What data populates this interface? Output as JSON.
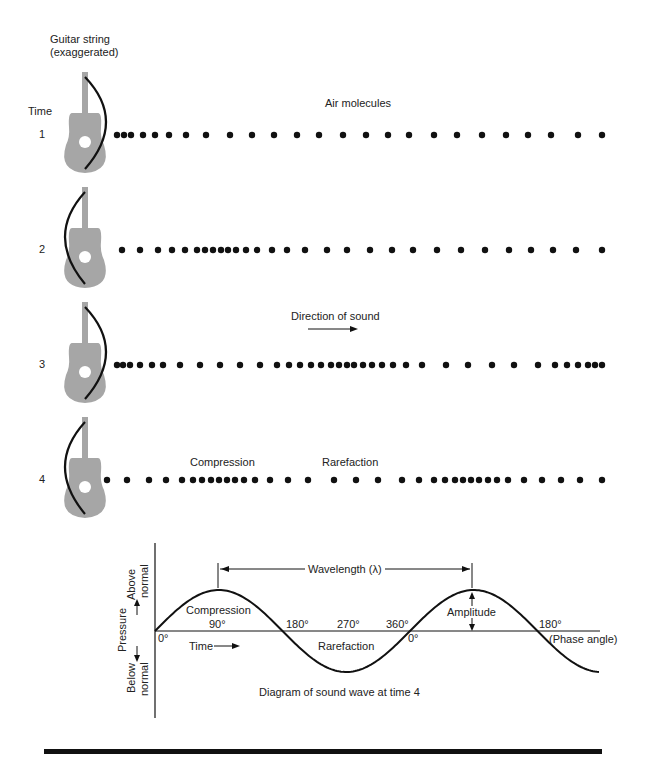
{
  "header": {
    "guitar_label_line1": "Guitar string",
    "guitar_label_line2": "(exaggerated)",
    "time_label": "Time",
    "air_molecules_label": "Air molecules",
    "direction_label": "Direction of sound",
    "compression_label": "Compression",
    "rarefaction_label": "Rarefaction"
  },
  "rows": [
    {
      "label": "1",
      "y": 135,
      "string_bow": "right",
      "dots": [
        117,
        124,
        131,
        143,
        155,
        169,
        186,
        206,
        230,
        252,
        274,
        297,
        319,
        343,
        366,
        388,
        409,
        434,
        457,
        482,
        506,
        528,
        551,
        578,
        602
      ]
    },
    {
      "label": "2",
      "y": 250,
      "string_bow": "left",
      "dots": [
        122,
        140,
        158,
        172,
        185,
        197,
        205,
        213,
        221,
        228,
        236,
        246,
        257,
        272,
        287,
        305,
        327,
        347,
        370,
        392,
        413,
        437,
        461,
        485,
        509,
        531,
        553,
        576,
        602
      ]
    },
    {
      "label": "3",
      "y": 365,
      "string_bow": "right",
      "dots": [
        117,
        123,
        130,
        140,
        152,
        163,
        180,
        200,
        220,
        240,
        260,
        277,
        289,
        300,
        311,
        321,
        331,
        339,
        347,
        354,
        363,
        372,
        382,
        393,
        406,
        422,
        446,
        468,
        492,
        514,
        538,
        555,
        567,
        578,
        588,
        595,
        602
      ]
    },
    {
      "label": "4",
      "y": 480,
      "string_bow": "left",
      "dots": [
        107,
        127,
        149,
        166,
        182,
        193,
        202,
        211,
        219,
        227,
        235,
        244,
        255,
        270,
        288,
        308,
        334,
        356,
        378,
        402,
        419,
        434,
        445,
        455,
        463,
        471,
        479,
        488,
        497,
        508,
        524,
        542,
        561,
        580,
        602
      ]
    }
  ],
  "wave_diagram": {
    "wavelength_label": "Wavelength (λ)",
    "amplitude_label": "Amplitude",
    "compression_label": "Compression",
    "rarefaction_label": "Rarefaction",
    "time_label": "Time",
    "phase_angle_label": "(Phase angle)",
    "pressure_label": "Pressure",
    "above_normal_line1": "Above",
    "above_normal_line2": "normal",
    "below_normal_line1": "Below",
    "below_normal_line2": "normal",
    "angles": {
      "a0": "0°",
      "a90": "90°",
      "a180": "180°",
      "a270": "270°",
      "a360": "360°",
      "a0b": "0°",
      "a180b": "180°"
    },
    "caption": "Diagram of sound wave at time 4"
  },
  "colors": {
    "ink": "#111111",
    "guitar": "#a6a6a6",
    "background": "#ffffff"
  }
}
